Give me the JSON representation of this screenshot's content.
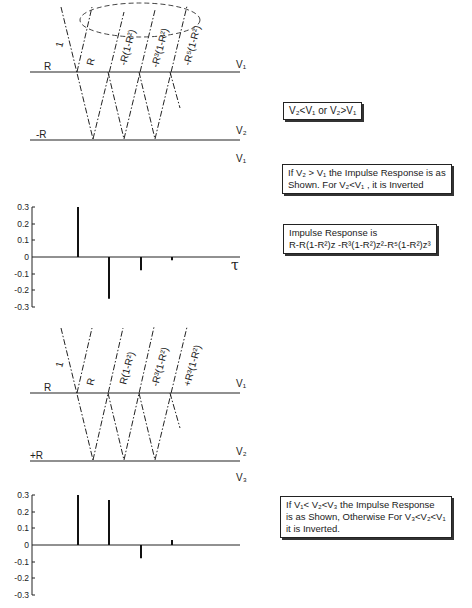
{
  "top_diagram": {
    "interface_labels": {
      "upper_left": "R",
      "lower_left": "-R",
      "right_1": "V₁",
      "right_2": "V₂",
      "right_3": "V₁"
    },
    "ray_labels": [
      "1",
      "R",
      "-R(1-R²)",
      "-R³(1-R²)",
      "-R⁵(1-R²)"
    ],
    "note_boxes": [
      "V₂<V₁ or V₂>V₁",
      "If V₂ > V₁ the Impulse Response is as\nShown. For V₂<V₁ , it is Inverted",
      "Impulse Response is\nR-R(1-R²)z -R³(1-R²)z²-R⁵(1-R²)z³"
    ]
  },
  "bottom_diagram": {
    "interface_labels": {
      "upper_left": "R",
      "lower_left": "+R",
      "right_1": "V₁",
      "right_2": "V₂",
      "right_3": "V₃"
    },
    "ray_labels": [
      "1",
      "R",
      "R(1-R²)",
      "-R³(1-R²)",
      "+R³(1-R²)"
    ],
    "note_box": "If V₁< V₂<V₃ the Impulse Response\nis as Shown, Otherwise For V₃<V₂<V₁\nit is Inverted."
  },
  "chart_data": [
    {
      "type": "bar",
      "title": "Impulse response (V₂ > V₁)",
      "xlabel": "τ",
      "ylabel": "",
      "categories": [
        "τ0",
        "τ1",
        "τ2",
        "τ3"
      ],
      "values": [
        0.3,
        -0.25,
        -0.08,
        -0.02
      ],
      "yticks": [
        "0.3",
        "0.2",
        "0.1",
        "0",
        "-0.1",
        "-0.2",
        "-0.3"
      ],
      "ylim": [
        -0.3,
        0.3
      ],
      "grid": false
    },
    {
      "type": "bar",
      "title": "Impulse response (V₁ < V₂ < V₃)",
      "xlabel": "",
      "ylabel": "",
      "categories": [
        "τ0",
        "τ1",
        "τ2",
        "τ3"
      ],
      "values": [
        0.3,
        0.27,
        -0.08,
        0.03
      ],
      "yticks": [
        "0.3",
        "0.2",
        "0.1",
        "0",
        "-0.1",
        "-0.2",
        "-0.3"
      ],
      "ylim": [
        -0.3,
        0.3
      ],
      "grid": false
    }
  ]
}
